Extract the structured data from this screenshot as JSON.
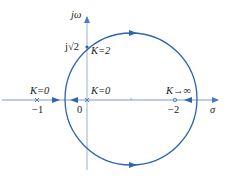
{
  "diagram": {
    "type": "root-locus",
    "axes": {
      "x_label": "σ",
      "y_label": "jω"
    },
    "labels": {
      "pole_left_k": "K=0",
      "pole_left_value": "−1",
      "origin_value": "0",
      "origin_k": "K=0",
      "zero_k": "K→∞",
      "zero_value": "−2",
      "jw_crossing": "j√2",
      "jw_crossing_k": "K=2"
    },
    "colors": {
      "locus": "#2e64b0",
      "axis": "#7a9bcc"
    }
  }
}
